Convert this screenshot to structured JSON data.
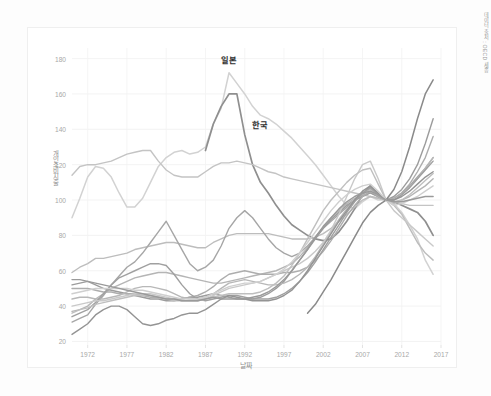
{
  "figure": {
    "source_note": "데이터 출처 : OECD 세종",
    "background": "#ffffff",
    "border_color": "#efefef"
  },
  "chart_data": {
    "type": "line",
    "title": "",
    "xlabel": "날짜",
    "ylabel": "개인소비지출",
    "xlim": [
      1970,
      2017
    ],
    "ylim": [
      18,
      186
    ],
    "grid": true,
    "legend": "inline-annotation",
    "xticks": [
      "1972",
      "1977",
      "1982",
      "1987",
      "1992",
      "1997",
      "2002",
      "2007",
      "2012",
      "2017"
    ],
    "xtick_values": [
      1972,
      1977,
      1982,
      1987,
      1992,
      1997,
      2002,
      2007,
      2012,
      2017
    ],
    "yticks": [
      "20",
      "40",
      "60",
      "80",
      "100",
      "120",
      "140",
      "160",
      "180"
    ],
    "ytick_values": [
      20,
      40,
      60,
      80,
      100,
      120,
      140,
      160,
      180
    ],
    "annotations": [
      {
        "text": "일본",
        "x": 1990.0,
        "y": 180.0,
        "color": "#2f2f2f"
      },
      {
        "text": "한국",
        "x": 1994.0,
        "y": 143.0,
        "color": "#2f2f2f"
      }
    ],
    "x": [
      1970,
      1971,
      1972,
      1973,
      1974,
      1975,
      1976,
      1977,
      1978,
      1979,
      1980,
      1981,
      1982,
      1983,
      1984,
      1985,
      1986,
      1987,
      1988,
      1989,
      1990,
      1991,
      1992,
      1993,
      1994,
      1995,
      1996,
      1997,
      1998,
      1999,
      2000,
      2001,
      2002,
      2003,
      2004,
      2005,
      2006,
      2007,
      2008,
      2009,
      2010,
      2011,
      2012,
      2013,
      2014,
      2015,
      2016
    ],
    "series": [
      {
        "name": "일본",
        "color": "#d2d2d2",
        "width": 1.5,
        "values": [
          90,
          101,
          113,
          119,
          118,
          113,
          104,
          96,
          96,
          101,
          110,
          119,
          124,
          127,
          128,
          126,
          127,
          130,
          143,
          152,
          172,
          166,
          160,
          153,
          148,
          146,
          143,
          139,
          135,
          130,
          125,
          120,
          114,
          108,
          102,
          97,
          95,
          99,
          102,
          100,
          100,
          98,
          93,
          86,
          78,
          66,
          58
        ]
      },
      {
        "name": "한국",
        "color": "#8f8f8f",
        "width": 1.7,
        "values": [
          null,
          null,
          null,
          null,
          null,
          null,
          null,
          null,
          null,
          null,
          null,
          null,
          null,
          null,
          null,
          null,
          null,
          128,
          143,
          153,
          160,
          160,
          137,
          120,
          110,
          104,
          97,
          91,
          86,
          83,
          80,
          78,
          77,
          78,
          82,
          88,
          95,
          103,
          108,
          103,
          100,
          99,
          97,
          95,
          93,
          88,
          80
        ]
      },
      {
        "name": "series-3",
        "color": "#c4c4c4",
        "width": 1.4,
        "values": [
          114,
          119,
          120,
          120,
          121,
          122,
          124,
          126,
          127,
          128,
          128,
          122,
          117,
          114,
          113,
          113,
          113,
          116,
          119,
          121,
          121,
          122,
          121,
          120,
          118,
          116,
          115,
          113,
          112,
          111,
          110,
          109,
          108,
          107,
          106,
          105,
          104,
          103,
          102,
          101,
          100,
          99,
          98,
          97,
          97,
          97,
          97
        ]
      },
      {
        "name": "series-4",
        "color": "#bdbdbd",
        "width": 1.4,
        "values": [
          59,
          62,
          64,
          67,
          67,
          68,
          69,
          70,
          72,
          73,
          74,
          75,
          76,
          76,
          75,
          74,
          73,
          73,
          76,
          78,
          80,
          81,
          81,
          81,
          81,
          81,
          80,
          79,
          78,
          78,
          78,
          79,
          81,
          84,
          88,
          92,
          96,
          100,
          102,
          101,
          100,
          97,
          92,
          84,
          76,
          70,
          66
        ]
      },
      {
        "name": "series-5",
        "color": "#b5b5b5",
        "width": 1.4,
        "values": [
          37,
          38,
          40,
          44,
          47,
          50,
          52,
          54,
          56,
          57,
          58,
          59,
          59,
          58,
          57,
          56,
          55,
          54,
          53,
          53,
          54,
          55,
          56,
          57,
          58,
          59,
          60,
          62,
          64,
          68,
          73,
          79,
          85,
          90,
          94,
          98,
          101,
          103,
          104,
          102,
          100,
          99,
          100,
          102,
          105,
          108,
          112
        ]
      },
      {
        "name": "series-6",
        "color": "#a6a6a6",
        "width": 1.4,
        "values": [
          31,
          33,
          35,
          41,
          46,
          52,
          57,
          62,
          65,
          70,
          76,
          82,
          88,
          80,
          72,
          64,
          60,
          62,
          66,
          74,
          84,
          90,
          94,
          90,
          84,
          78,
          73,
          70,
          68,
          70,
          74,
          79,
          84,
          88,
          92,
          96,
          100,
          104,
          107,
          103,
          100,
          101,
          104,
          108,
          113,
          118,
          124
        ]
      },
      {
        "name": "series-7",
        "color": "#9c9c9c",
        "width": 1.4,
        "values": [
          52,
          53,
          54,
          52,
          50,
          49,
          48,
          47,
          46,
          45,
          44,
          44,
          43,
          43,
          44,
          45,
          45,
          46,
          47,
          46,
          45,
          44,
          44,
          44,
          45,
          47,
          50,
          54,
          60,
          66,
          72,
          78,
          84,
          89,
          93,
          97,
          100,
          102,
          104,
          102,
          100,
          102,
          106,
          112,
          120,
          132,
          146
        ]
      },
      {
        "name": "series-8",
        "color": "#adadad",
        "width": 1.4,
        "values": [
          50,
          50,
          50,
          49,
          48,
          48,
          47,
          47,
          47,
          46,
          45,
          45,
          44,
          44,
          44,
          45,
          46,
          48,
          51,
          55,
          58,
          59,
          60,
          59,
          58,
          58,
          58,
          59,
          59,
          60,
          62,
          66,
          71,
          77,
          84,
          91,
          97,
          102,
          105,
          102,
          100,
          101,
          104,
          109,
          116,
          124,
          136
        ]
      },
      {
        "name": "series-9",
        "color": "#b8b8b8",
        "width": 1.4,
        "values": [
          44,
          45,
          45,
          44,
          44,
          45,
          46,
          48,
          50,
          51,
          51,
          50,
          49,
          47,
          45,
          44,
          44,
          45,
          47,
          50,
          53,
          54,
          55,
          54,
          53,
          52,
          52,
          53,
          55,
          58,
          62,
          68,
          75,
          82,
          89,
          95,
          100,
          104,
          106,
          103,
          100,
          100,
          103,
          107,
          112,
          118,
          124
        ]
      },
      {
        "name": "series-10",
        "color": "#a0a0a0",
        "width": 1.4,
        "values": [
          34,
          36,
          38,
          42,
          47,
          52,
          56,
          58,
          60,
          62,
          64,
          64,
          63,
          58,
          52,
          47,
          44,
          43,
          44,
          45,
          46,
          46,
          45,
          44,
          44,
          44,
          45,
          47,
          50,
          54,
          59,
          65,
          72,
          79,
          86,
          93,
          99,
          104,
          107,
          103,
          100,
          100,
          103,
          107,
          112,
          117,
          122
        ]
      },
      {
        "name": "series-11",
        "color": "#949494",
        "width": 1.4,
        "values": [
          24,
          27,
          30,
          35,
          38,
          40,
          40,
          38,
          34,
          30,
          29,
          30,
          32,
          33,
          35,
          36,
          36,
          38,
          41,
          44,
          46,
          45,
          44,
          43,
          43,
          43,
          44,
          46,
          49,
          54,
          60,
          67,
          74,
          81,
          88,
          94,
          100,
          105,
          108,
          104,
          100,
          100,
          102,
          105,
          109,
          113,
          116
        ]
      },
      {
        "name": "series-12",
        "color": "#c9c9c9",
        "width": 1.4,
        "values": [
          40,
          41,
          42,
          43,
          43,
          44,
          45,
          46,
          47,
          47,
          47,
          46,
          45,
          44,
          43,
          43,
          43,
          44,
          46,
          48,
          50,
          51,
          52,
          53,
          54,
          56,
          58,
          60,
          62,
          64,
          67,
          71,
          76,
          83,
          92,
          102,
          112,
          120,
          122,
          112,
          100,
          94,
          90,
          86,
          82,
          78,
          74
        ]
      },
      {
        "name": "series-13",
        "color": "#8a8a8a",
        "width": 1.5,
        "values": [
          null,
          null,
          null,
          null,
          null,
          null,
          null,
          null,
          null,
          null,
          null,
          null,
          null,
          null,
          null,
          null,
          null,
          null,
          null,
          null,
          null,
          null,
          null,
          null,
          null,
          null,
          null,
          null,
          null,
          null,
          36,
          41,
          48,
          55,
          63,
          71,
          79,
          87,
          93,
          97,
          100,
          106,
          116,
          130,
          146,
          160,
          168
        ]
      },
      {
        "name": "series-14",
        "color": "#bfbfbf",
        "width": 1.4,
        "values": [
          36,
          38,
          39,
          41,
          42,
          43,
          44,
          45,
          46,
          46,
          46,
          45,
          44,
          43,
          43,
          43,
          43,
          44,
          45,
          46,
          47,
          47,
          47,
          47,
          48,
          50,
          53,
          57,
          63,
          70,
          78,
          86,
          94,
          100,
          105,
          110,
          114,
          117,
          118,
          109,
          100,
          98,
          100,
          103,
          107,
          111,
          115
        ]
      },
      {
        "name": "series-15",
        "color": "#cfcfcf",
        "width": 1.4,
        "values": [
          47,
          48,
          49,
          50,
          50,
          50,
          50,
          50,
          49,
          49,
          48,
          47,
          46,
          45,
          44,
          44,
          44,
          45,
          47,
          49,
          51,
          52,
          53,
          53,
          54,
          56,
          58,
          61,
          65,
          70,
          76,
          82,
          88,
          94,
          99,
          103,
          106,
          108,
          109,
          105,
          100,
          97,
          98,
          100,
          102,
          105,
          108
        ]
      },
      {
        "name": "series-16",
        "color": "#9a9a9a",
        "width": 1.4,
        "values": [
          55,
          55,
          54,
          53,
          52,
          51,
          50,
          49,
          48,
          47,
          46,
          45,
          44,
          44,
          43,
          43,
          43,
          44,
          45,
          44,
          44,
          44,
          44,
          45,
          46,
          48,
          51,
          55,
          60,
          66,
          72,
          79,
          85,
          90,
          95,
          99,
          102,
          104,
          105,
          103,
          100,
          99,
          99,
          100,
          101,
          102,
          102
        ]
      }
    ]
  }
}
